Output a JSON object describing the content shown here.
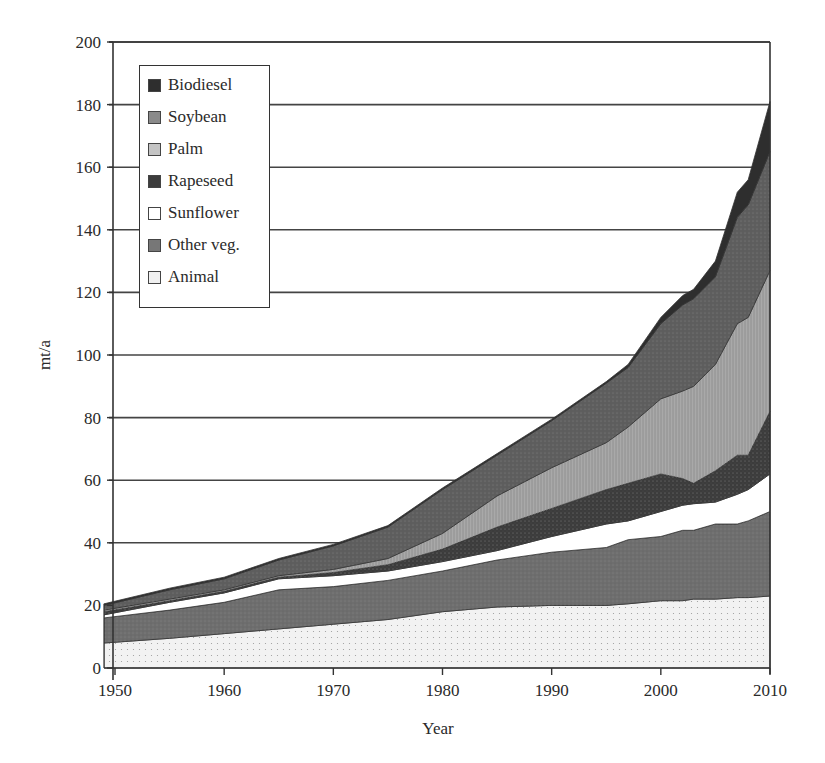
{
  "chart_data": {
    "type": "area",
    "stacked": true,
    "title": "",
    "xlabel": "Year",
    "ylabel": "mt/a",
    "xlim": [
      1949,
      2010
    ],
    "ylim": [
      0,
      200
    ],
    "x_ticks": [
      1950,
      1960,
      1970,
      1980,
      1990,
      2000,
      2010
    ],
    "y_ticks": [
      0,
      20,
      40,
      60,
      80,
      100,
      120,
      140,
      160,
      180,
      200
    ],
    "grid": "horizontal",
    "legend_position": "upper-left-inside",
    "x": [
      1949,
      1955,
      1960,
      1965,
      1970,
      1975,
      1980,
      1985,
      1990,
      1995,
      1997,
      2000,
      2002,
      2003,
      2005,
      2007,
      2008,
      2010
    ],
    "series": [
      {
        "name": "Animal",
        "color": "#f2f2f2",
        "values": [
          8,
          9.5,
          11,
          12.5,
          14,
          15.5,
          18,
          19.5,
          20,
          20,
          20.5,
          21.5,
          21.5,
          22,
          22,
          22.5,
          22.5,
          23
        ]
      },
      {
        "name": "Other veg.",
        "color": "#6e6e6e",
        "values": [
          8,
          9,
          10,
          12.5,
          12,
          12.5,
          13,
          15,
          17,
          18.5,
          20.5,
          20.5,
          22.5,
          22,
          24,
          23.5,
          24.5,
          27
        ]
      },
      {
        "name": "Sunflower",
        "color": "#ffffff",
        "values": [
          1,
          2.5,
          3,
          3.5,
          3.5,
          3,
          3,
          3,
          5,
          7.5,
          6,
          8,
          8,
          8.5,
          7,
          9.5,
          10,
          12
        ]
      },
      {
        "name": "Rapeseed",
        "color": "#3c3c3c",
        "values": [
          1,
          0.5,
          0.5,
          0.5,
          1,
          2,
          4,
          7.5,
          9,
          11,
          12,
          12,
          8.5,
          6.5,
          10,
          12.5,
          11,
          20
        ]
      },
      {
        "name": "Palm",
        "color": "#a9a9a9",
        "values": [
          0.5,
          0.5,
          0.5,
          0.5,
          1,
          2,
          5,
          10,
          13,
          15,
          18,
          24,
          28,
          31,
          34,
          42,
          44,
          45
        ]
      },
      {
        "name": "Soybean",
        "color": "#5e5e5e",
        "values": [
          1.5,
          3,
          3.5,
          5,
          7.5,
          10,
          14,
          13,
          15,
          19,
          19,
          24,
          27.5,
          28,
          28,
          34,
          36,
          38
        ]
      },
      {
        "name": "Biodiesel",
        "color": "#2e2e2e",
        "values": [
          0.5,
          0.5,
          0.5,
          0.5,
          0.5,
          0.5,
          0.5,
          0.5,
          0.5,
          0.5,
          1,
          2,
          3,
          3,
          5,
          8,
          8,
          16
        ]
      }
    ]
  },
  "legend": {
    "items": [
      {
        "label": "Biodiesel",
        "color": "#2e2e2e"
      },
      {
        "label": "Soybean",
        "color": "#8a8a8a"
      },
      {
        "label": "Palm",
        "color": "#c4c4c4"
      },
      {
        "label": "Rapeseed",
        "color": "#3c3c3c"
      },
      {
        "label": "Sunflower",
        "color": "#ffffff"
      },
      {
        "label": "Other veg.",
        "color": "#777777"
      },
      {
        "label": "Animal",
        "color": "#f0f0f0"
      }
    ]
  },
  "axes": {
    "xlabel": "Year",
    "ylabel": "mt/a"
  }
}
